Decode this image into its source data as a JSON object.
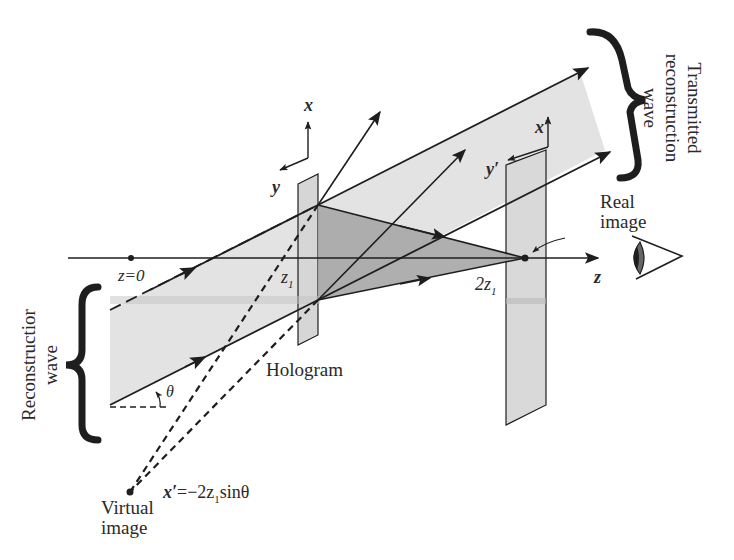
{
  "figure": {
    "labels": {
      "transmitted_wave": [
        "Transmitted",
        "reconstruction",
        "wave"
      ],
      "reconstruction_wave": [
        "Reconstructior",
        "wave"
      ],
      "real_image": [
        "Real",
        "image"
      ],
      "virtual_image": [
        "Virtual",
        "image"
      ],
      "hologram": "Hologram",
      "z0": "z=0",
      "z1": "z",
      "z1_sub": "1",
      "two_z1": "2z",
      "two_z1_sub": "1",
      "z_axis": "z",
      "x_axis": "x",
      "y_axis": "y",
      "x_prime": "x′",
      "y_prime": "y′",
      "theta": "θ",
      "virtual_formula_lhs": "x′",
      "virtual_formula_mid": "=−2z",
      "virtual_formula_sub": "1",
      "virtual_formula_rhs": "sinθ"
    },
    "icons": {
      "eye": "eye-icon"
    },
    "colors": {
      "beam_fill": "#e2e2e2",
      "cone_fill": "#a8a8a8",
      "plate_fill": "#dcdcdc",
      "line": "#1e1e1e",
      "background": "#ffffff"
    }
  }
}
